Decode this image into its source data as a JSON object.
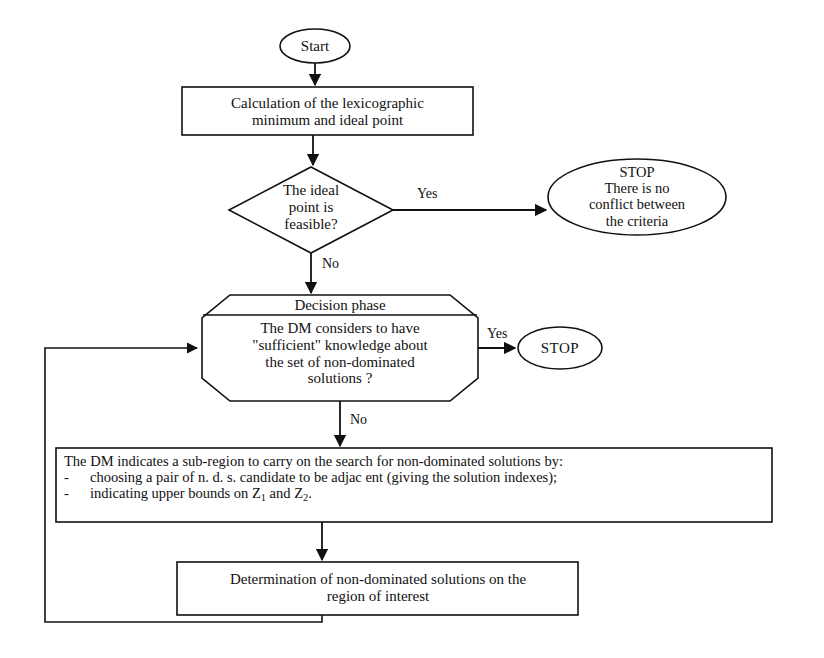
{
  "diagram": {
    "type": "flowchart",
    "stroke_color": "#111111",
    "fill_color": "#ffffff",
    "background": "#ffffff"
  },
  "nodes": {
    "start": {
      "shape": "ellipse",
      "label": "Start"
    },
    "calculation": {
      "shape": "rectangle",
      "line1": "Calculation of the lexicographic",
      "line2": "minimum and ideal point"
    },
    "ideal_decision": {
      "shape": "diamond",
      "line1": "The ideal",
      "line2": "point is",
      "line3": "feasible?"
    },
    "stop_no_conflict": {
      "shape": "ellipse",
      "line1": "STOP",
      "line2": "There is no",
      "line3": "conflict between",
      "line4": "the criteria"
    },
    "decision_phase": {
      "shape": "octagon",
      "header": "Decision phase",
      "line1": "The DM considers to have",
      "line2": "\"sufficient\" knowledge about",
      "line3": "the set of non-dominated",
      "line4": "solutions ?"
    },
    "stop_simple": {
      "shape": "ellipse",
      "label": "STOP"
    },
    "dm_subregion": {
      "shape": "rectangle",
      "line1": "The DM indicates a sub-region to carry on the search for non-dominated solutions by:",
      "bullet_marker": "-",
      "bullet1": "choosing a pair of n. d. s. candidate to be adjac ent (giving the solution indexes);",
      "bullet2_prefix": "indicating upper bounds on Z",
      "bullet2_sub1": "1",
      "bullet2_mid": " and Z",
      "bullet2_sub2": "2",
      "bullet2_suffix": "."
    },
    "determination": {
      "shape": "rectangle",
      "line1": "Determination of non-dominated solutions on the",
      "line2": "region of interest"
    }
  },
  "edges": {
    "start_to_calculation": {
      "label": ""
    },
    "calculation_to_ideal": {
      "label": ""
    },
    "ideal_to_stop": {
      "label": "Yes"
    },
    "ideal_to_decision_phase": {
      "label": "No"
    },
    "decision_to_stop": {
      "label": "Yes"
    },
    "decision_to_dm": {
      "label": "No"
    },
    "dm_to_determination": {
      "label": ""
    },
    "determination_to_decision_loop": {
      "label": ""
    }
  }
}
